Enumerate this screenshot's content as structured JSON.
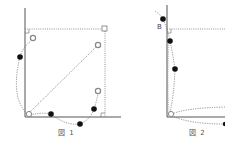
{
  "figures": [
    {
      "caption": "図 1",
      "axes": {
        "origin": [
          25,
          117
        ],
        "y_top": 8,
        "x_right": 120
      },
      "dotted_rect": {
        "x1": 25,
        "y1": 29,
        "x2": 105,
        "y2": 117
      },
      "corner_square": [
        105,
        29
      ],
      "open_circles": [
        [
          33,
          38
        ],
        [
          98,
          45
        ],
        [
          98,
          91
        ],
        [
          29,
          114
        ]
      ],
      "filled_dots": [
        [
          20,
          57
        ],
        [
          51,
          114
        ],
        [
          80,
          124
        ],
        [
          94,
          109
        ]
      ]
    },
    {
      "caption": "図 2",
      "label_b": "B",
      "axes": {
        "origin": [
          167,
          117
        ],
        "y_top": 5,
        "x_right": 225
      },
      "dotted_top_y": 29,
      "open_circles": [
        [
          171,
          114
        ]
      ],
      "filled_dots": [
        [
          163,
          19
        ],
        [
          170,
          41
        ],
        [
          175,
          69
        ],
        [
          224,
          124
        ]
      ]
    }
  ],
  "colors": {
    "line": "#555555",
    "dot": "#111111",
    "open": "#888888"
  }
}
